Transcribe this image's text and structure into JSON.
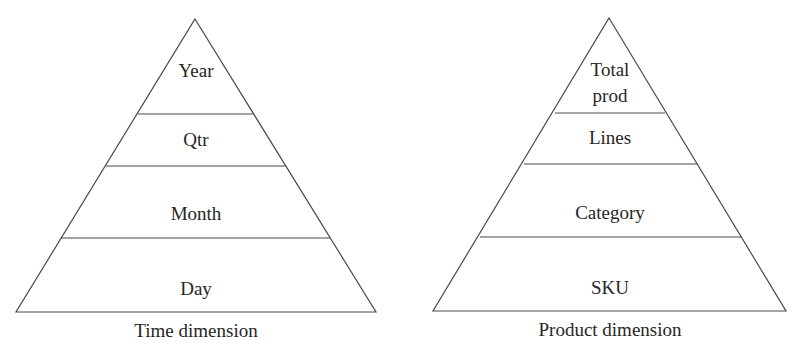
{
  "diagram": {
    "colors": {
      "line": "#4a4a4a",
      "text": "#262626",
      "background": "#ffffff"
    },
    "pyramids": [
      {
        "caption": "Time dimension",
        "levels": [
          {
            "label": "Year"
          },
          {
            "label": "Qtr"
          },
          {
            "label": "Month"
          },
          {
            "label": "Day"
          }
        ]
      },
      {
        "caption": "Product dimension",
        "levels": [
          {
            "label_line1": "Total",
            "label_line2": "prod"
          },
          {
            "label": "Lines"
          },
          {
            "label": "Category"
          },
          {
            "label": "SKU"
          }
        ]
      }
    ]
  }
}
